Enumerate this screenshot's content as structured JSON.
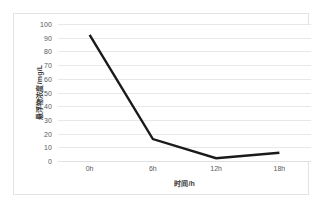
{
  "chart_data": {
    "type": "line",
    "title": "",
    "subtitle": "",
    "xlabel": "时间/h",
    "ylabel": "悬浮物浓度/mg/L",
    "categories": [
      "0h",
      "6h",
      "12h",
      "18h"
    ],
    "x_values": [
      0,
      6,
      12,
      18
    ],
    "values": [
      92,
      16,
      2,
      6
    ],
    "series": [
      {
        "name": "悬浮物浓度",
        "values": [
          92,
          16,
          2,
          6
        ],
        "color": "#1a1a1a",
        "line_width": 2.4,
        "markers": false
      }
    ],
    "ylim": [
      0,
      100
    ],
    "y_ticks": [
      0,
      10,
      20,
      30,
      40,
      50,
      60,
      70,
      80,
      90,
      100
    ],
    "y_tick_labels": [
      "0",
      "10",
      "20",
      "30",
      "40",
      "50",
      "60",
      "70",
      "80",
      "90",
      "100"
    ],
    "x_tick_labels": [
      "0h",
      "6h",
      "12h",
      "18h"
    ],
    "grid": {
      "horizontal": true,
      "vertical": false,
      "color": "#e8e8e8"
    },
    "legend": {
      "visible": false,
      "position": "none",
      "entries": []
    },
    "annotations": [],
    "frame": {
      "border_color": "#e3e3e3",
      "plot_background": "#ffffff"
    }
  }
}
